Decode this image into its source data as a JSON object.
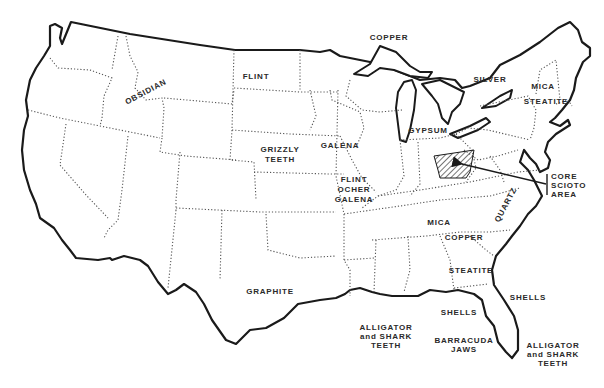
{
  "map": {
    "subject": "United States outline with state borders",
    "colors": {
      "outline": "#1a1a1a",
      "border": "#555555",
      "background": "#ffffff"
    },
    "highlight": {
      "name": "core-scioto-area",
      "label_lines": [
        "CORE",
        "SCIOTO",
        "AREA"
      ]
    },
    "labels": [
      {
        "id": "obsidian",
        "lines": [
          "OBSIDIAN"
        ]
      },
      {
        "id": "flint-north",
        "lines": [
          "FLINT"
        ]
      },
      {
        "id": "grizzly-teeth",
        "lines": [
          "GRIZZLY",
          "TEETH"
        ]
      },
      {
        "id": "galena-north",
        "lines": [
          "GALENA"
        ]
      },
      {
        "id": "flint-ocher-galena",
        "lines": [
          "FLINT",
          "OCHER",
          "GALENA"
        ]
      },
      {
        "id": "copper-north",
        "lines": [
          "COPPER"
        ]
      },
      {
        "id": "silver",
        "lines": [
          "SILVER"
        ]
      },
      {
        "id": "mica-north",
        "lines": [
          "MICA"
        ]
      },
      {
        "id": "steatite-north",
        "lines": [
          "STEATITE"
        ]
      },
      {
        "id": "gypsum",
        "lines": [
          "GYPSUM"
        ]
      },
      {
        "id": "quartz",
        "lines": [
          "QUARTZ"
        ]
      },
      {
        "id": "mica-south",
        "lines": [
          "MICA"
        ]
      },
      {
        "id": "copper-south",
        "lines": [
          "COPPER"
        ]
      },
      {
        "id": "steatite-south",
        "lines": [
          "STEATITE"
        ]
      },
      {
        "id": "graphite",
        "lines": [
          "GRAPHITE"
        ]
      },
      {
        "id": "shells-atlantic",
        "lines": [
          "SHELLS"
        ]
      },
      {
        "id": "shells-gulf",
        "lines": [
          "SHELLS"
        ]
      },
      {
        "id": "alligator-gulf",
        "lines": [
          "ALLIGATOR",
          "and SHARK",
          "TEETH"
        ]
      },
      {
        "id": "barracuda-jaws",
        "lines": [
          "BARRACUDA",
          "JAWS"
        ]
      },
      {
        "id": "alligator-atlantic",
        "lines": [
          "ALLIGATOR",
          "and SHARK",
          "TEETH"
        ]
      }
    ]
  }
}
